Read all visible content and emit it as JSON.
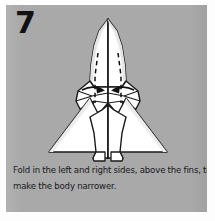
{
  "panel": {
    "background_color": "#a9a9a9",
    "page_background_color": "#ffffff"
  },
  "step": {
    "number": "7"
  },
  "caption": {
    "line1": "Fold in the left and right sides, above the fins, to",
    "line2": "make the body narrower.",
    "full_text": "Fold in the left and right sides, above the fins, to make the body narrower.",
    "text_color": "#17171a"
  },
  "diagram": {
    "type": "origami-instruction",
    "paper_fill_color": "#ffffff",
    "paper_shade_color": "#e9e9e9",
    "line_color": "#1a1a1a",
    "fold_line_style": "dashed",
    "arrow_count": 2,
    "arrow_direction": "inward",
    "fold_line_count": 2,
    "center_crease": "vertical",
    "fin_count": 2
  }
}
